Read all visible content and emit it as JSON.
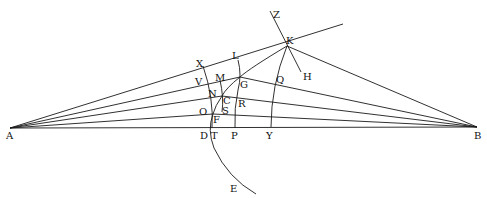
{
  "diagram": {
    "type": "geometric-construction",
    "labels": {
      "A": "A",
      "B": "B",
      "K": "K",
      "Z": "Z",
      "H": "H",
      "X": "X",
      "L": "L",
      "V": "V",
      "M": "M",
      "G": "G",
      "Q": "Q",
      "N": "N",
      "C": "C",
      "R": "R",
      "O": "O",
      "S": "S",
      "F": "F",
      "D": "D",
      "T": "T",
      "P": "P",
      "Y": "Y",
      "E": "E"
    },
    "colors": {
      "stroke": "#1a1a1a",
      "text": "#111111",
      "background": "#ffffff"
    }
  }
}
